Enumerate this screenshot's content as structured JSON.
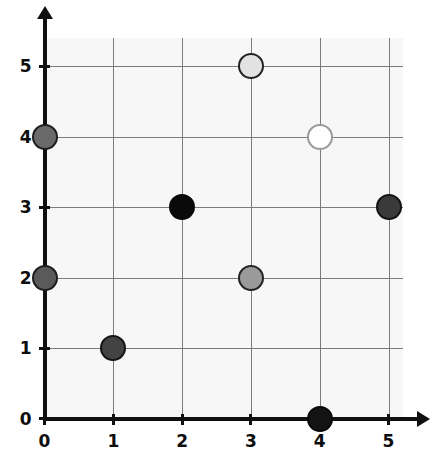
{
  "chart_data": {
    "type": "scatter",
    "title": "",
    "subtitle": "",
    "xlabel": "",
    "ylabel": "",
    "xlim": [
      0,
      5
    ],
    "ylim": [
      0,
      5
    ],
    "grid": true,
    "legend": "none",
    "x_ticks": [
      "0",
      "1",
      "2",
      "3",
      "4",
      "5"
    ],
    "y_ticks": [
      "0",
      "1",
      "2",
      "3",
      "4",
      "5"
    ],
    "x_tick_values": [
      0,
      1,
      2,
      3,
      4,
      5
    ],
    "y_tick_values": [
      0,
      1,
      2,
      3,
      4,
      5
    ],
    "points": [
      {
        "label": "point-0-4",
        "x": 0,
        "y": 4,
        "fill": "#6a6a6a",
        "stroke": "#1d1d1d",
        "radius_px": 13
      },
      {
        "label": "point-3-5",
        "x": 3,
        "y": 5,
        "fill": "#e2e2e2",
        "stroke": "#232323",
        "radius_px": 13
      },
      {
        "label": "point-4-4",
        "x": 4,
        "y": 4,
        "fill": "#ffffff",
        "stroke": "#9a9a9a",
        "radius_px": 13
      },
      {
        "label": "point-2-3",
        "x": 2,
        "y": 3,
        "fill": "#0a0a0a",
        "stroke": "#0a0a0a",
        "radius_px": 13
      },
      {
        "label": "point-5-3",
        "x": 5,
        "y": 3,
        "fill": "#3a3a3a",
        "stroke": "#121212",
        "radius_px": 13
      },
      {
        "label": "point-0-2",
        "x": 0,
        "y": 2,
        "fill": "#5a5a5a",
        "stroke": "#1d1d1d",
        "radius_px": 13
      },
      {
        "label": "point-3-2",
        "x": 3,
        "y": 2,
        "fill": "#9a9a9a",
        "stroke": "#232323",
        "radius_px": 13
      },
      {
        "label": "point-1-1",
        "x": 1,
        "y": 1,
        "fill": "#434343",
        "stroke": "#141414",
        "radius_px": 13
      },
      {
        "label": "point-4-0",
        "x": 4,
        "y": 0,
        "fill": "#141414",
        "stroke": "#0a0a0a",
        "radius_px": 13
      }
    ],
    "colors": {
      "panel_background": "#f7f7f7",
      "gridline": "#7c7c7c",
      "axis": "#101010",
      "tick_label": "#0d0d0d",
      "page_background": "#ffffff"
    }
  }
}
